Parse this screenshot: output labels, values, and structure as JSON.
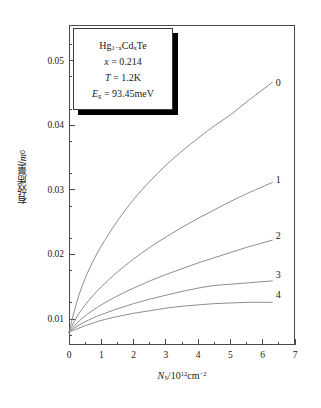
{
  "chart_data": {
    "type": "line",
    "title": "",
    "xlabel": "Ns/10^12 cm^-2",
    "ylabel": "有效质量/m0",
    "xlim": [
      0,
      7
    ],
    "ylim": [
      0.006,
      0.0555
    ],
    "grid": false,
    "legend_position": "curve-end-labels",
    "x_ticks": [
      "0",
      "1",
      "2",
      "3",
      "4",
      "5",
      "6",
      "7"
    ],
    "x_tick_values": [
      0,
      1,
      2,
      3,
      4,
      5,
      6,
      7
    ],
    "x_minor_tick_step": 0.5,
    "y_ticks": [
      "0.01",
      "0.02",
      "0.03",
      "0.04",
      "0.05"
    ],
    "y_tick_values": [
      0.01,
      0.02,
      0.03,
      0.04,
      0.05
    ],
    "y_minor_tick_step": 0.005,
    "x": [
      0,
      0.25,
      0.5,
      0.75,
      1,
      1.5,
      2,
      2.5,
      3,
      3.5,
      4,
      4.5,
      5,
      5.5,
      6
    ],
    "series": [
      {
        "name": "0",
        "label": "0",
        "values": [
          0.008,
          0.0128,
          0.0163,
          0.019,
          0.0213,
          0.0252,
          0.0285,
          0.0313,
          0.0338,
          0.036,
          0.038,
          0.0399,
          0.0416,
          0.0436,
          0.0455
        ]
      },
      {
        "name": "1",
        "label": "1",
        "values": [
          0.008,
          0.0104,
          0.0122,
          0.0137,
          0.015,
          0.0173,
          0.0193,
          0.0211,
          0.0227,
          0.0242,
          0.0256,
          0.0269,
          0.0282,
          0.0294,
          0.0305
        ]
      },
      {
        "name": "2",
        "label": "2",
        "values": [
          0.008,
          0.0094,
          0.0105,
          0.0114,
          0.0122,
          0.0136,
          0.0148,
          0.0159,
          0.0169,
          0.0178,
          0.0187,
          0.0195,
          0.0203,
          0.0211,
          0.0218
        ]
      },
      {
        "name": "3",
        "label": "3",
        "values": [
          0.008,
          0.0089,
          0.0096,
          0.0102,
          0.0107,
          0.0116,
          0.0124,
          0.0131,
          0.0137,
          0.0143,
          0.0148,
          0.0152,
          0.0154,
          0.0156,
          0.0158
        ]
      },
      {
        "name": "4",
        "label": "4",
        "values": [
          0.008,
          0.0085,
          0.009,
          0.0094,
          0.0098,
          0.0104,
          0.0109,
          0.0113,
          0.0117,
          0.012,
          0.0122,
          0.0124,
          0.0125,
          0.0126,
          0.0126
        ]
      }
    ],
    "annotations": {
      "material": "Hg1-xCdxTe",
      "composition": "x = 0.214",
      "temperature": "T = 1.2K",
      "bandgap": "Eg = 93.45meV"
    },
    "colors": {
      "curve": "#808080",
      "axis": "#4a4a4a",
      "text": "#1a1a1a",
      "shadow": "#000000"
    }
  },
  "axes": {
    "y_tick_labels": [
      "0.05",
      "0.04",
      "0.03",
      "0.02",
      "0.01"
    ],
    "x_tick_labels": [
      "0",
      "1",
      "2",
      "3",
      "4",
      "5",
      "6",
      "7"
    ],
    "y_axis_title_cn": "有效质量/",
    "y_axis_title_var": "m",
    "y_axis_title_sub": "0",
    "x_axis_title_var": "N",
    "x_axis_title_sub": "S",
    "x_axis_title_rest": "/10",
    "x_axis_title_exp": "12",
    "x_axis_title_unit": "cm",
    "x_axis_title_unit_exp": "−2"
  },
  "legend_box": {
    "line1_a": "Hg",
    "line1_sub1": "1−x",
    "line1_b": "Cd",
    "line1_sub2": "x",
    "line1_c": "Te",
    "line2_var": "x",
    "line2_val": "= 0.214",
    "line3_var": "T",
    "line3_val": "= 1.2K",
    "line4_var": "E",
    "line4_sub": "g",
    "line4_val": "= 93.45meV"
  },
  "curve_labels": [
    "0",
    "1",
    "2",
    "3",
    "4"
  ]
}
